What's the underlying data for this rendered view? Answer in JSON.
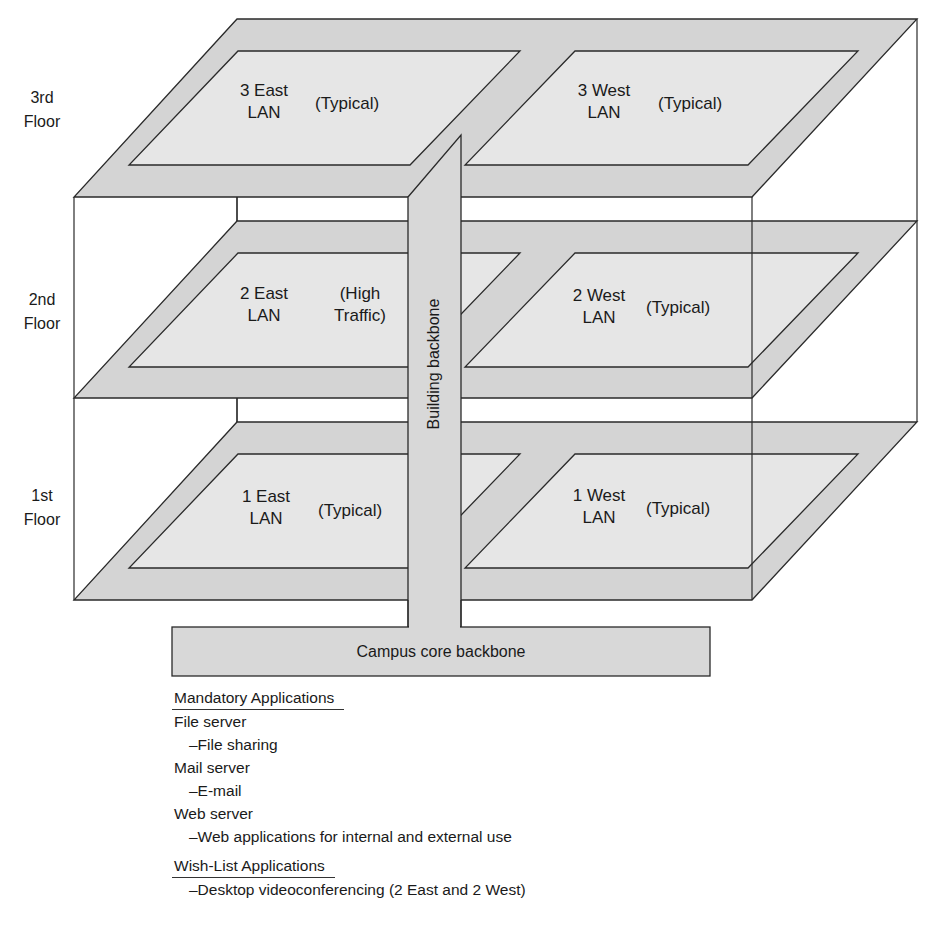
{
  "colors": {
    "plate_fill": "#d4d4d4",
    "lan_fill": "#e6e6e6",
    "backbone_fill": "#d8d8d8",
    "stroke": "#2a2a2a",
    "background": "#ffffff"
  },
  "floors": [
    {
      "label_line1": "3rd",
      "label_line2": "Floor",
      "lans": [
        {
          "name_line1": "3 East",
          "name_line2": "LAN",
          "traffic_line1": "(Typical)",
          "traffic_line2": ""
        },
        {
          "name_line1": "3 West",
          "name_line2": "LAN",
          "traffic_line1": "(Typical)",
          "traffic_line2": ""
        }
      ]
    },
    {
      "label_line1": "2nd",
      "label_line2": "Floor",
      "lans": [
        {
          "name_line1": "2 East",
          "name_line2": "LAN",
          "traffic_line1": "(High",
          "traffic_line2": "Traffic)"
        },
        {
          "name_line1": "2 West",
          "name_line2": "LAN",
          "traffic_line1": "(Typical)",
          "traffic_line2": ""
        }
      ]
    },
    {
      "label_line1": "1st",
      "label_line2": "Floor",
      "lans": [
        {
          "name_line1": "1 East",
          "name_line2": "LAN",
          "traffic_line1": "(Typical)",
          "traffic_line2": ""
        },
        {
          "name_line1": "1 West",
          "name_line2": "LAN",
          "traffic_line1": "(Typical)",
          "traffic_line2": ""
        }
      ]
    }
  ],
  "building_backbone": "Building backbone",
  "campus_backbone": "Campus core backbone",
  "mandatory": {
    "heading": "Mandatory Applications",
    "items": [
      {
        "server": "File server",
        "use": "–File sharing"
      },
      {
        "server": "Mail server",
        "use": "–E-mail"
      },
      {
        "server": "Web server",
        "use": "–Web applications for internal and external use"
      }
    ]
  },
  "wishlist": {
    "heading": "Wish-List Applications",
    "items": [
      {
        "use": "–Desktop videoconferencing (2 East and 2 West)"
      }
    ]
  }
}
